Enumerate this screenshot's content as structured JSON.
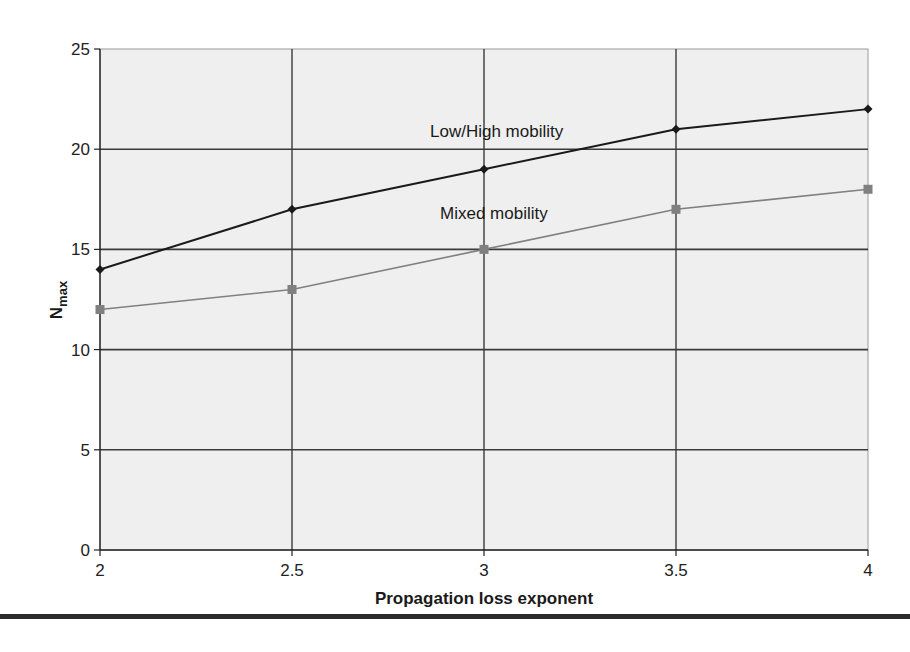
{
  "chart_data": {
    "type": "line",
    "title": "",
    "xlabel": "Propagation loss exponent",
    "ylabel": "N",
    "ylabel_subscript": "max",
    "x": [
      2,
      2.5,
      3,
      3.5,
      4
    ],
    "xlim": [
      2,
      4
    ],
    "ylim": [
      0,
      25
    ],
    "x_ticks": [
      "2",
      "2.5",
      "3",
      "3.5",
      "4"
    ],
    "y_ticks": [
      "0",
      "5",
      "10",
      "15",
      "20",
      "25"
    ],
    "grid": true,
    "legend_position": "inline labels",
    "series": [
      {
        "name": "Low/High mobility",
        "values": [
          14,
          17,
          19,
          21,
          22
        ],
        "color": "#1a1a1a",
        "marker": "diamond"
      },
      {
        "name": "Mixed mobility",
        "values": [
          12,
          13,
          15,
          17,
          18
        ],
        "color": "#808080",
        "marker": "square"
      }
    ]
  },
  "labels": {
    "series_1": "Low/High mobility",
    "series_2": "Mixed mobility",
    "xlabel": "Propagation loss exponent",
    "ylabel_main": "N",
    "ylabel_sub": "max"
  },
  "colors": {
    "plot_bg": "#efefef",
    "gridline": "#3a3a3a",
    "series_1": "#1a1a1a",
    "series_2": "#808080"
  }
}
